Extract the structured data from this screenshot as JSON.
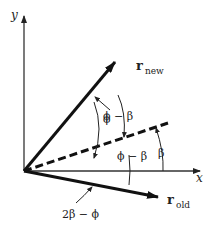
{
  "figure": {
    "axes": {
      "x_label": "x",
      "y_label": "y"
    },
    "vectors": {
      "r_new": {
        "base": "r",
        "subscript": "new"
      },
      "r_old": {
        "base": "r",
        "subscript": "old"
      }
    },
    "angle_labels": {
      "phi": "ϕ",
      "phi_minus_beta_upper": "ϕ − β",
      "phi_minus_beta_lower": "ϕ − β",
      "beta": "β",
      "two_beta_minus_phi": "2β − ϕ"
    },
    "colors": {
      "stroke": "#111111",
      "axis": "#333333"
    }
  }
}
